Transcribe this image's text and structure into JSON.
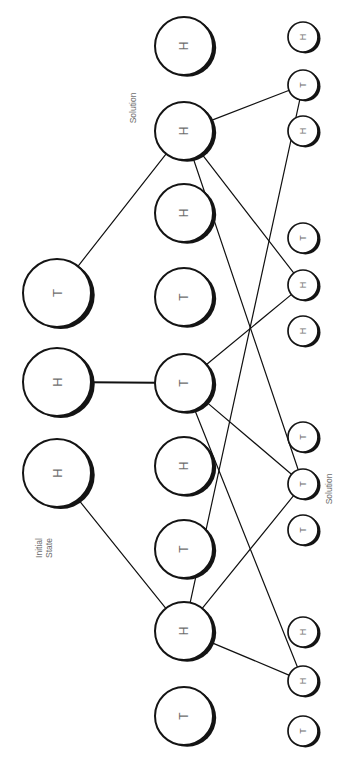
{
  "figure": {
    "orientation_degrees": 90,
    "background_color": "#ffffff",
    "ink_color": "#141414",
    "label_color": "#6e6e6e"
  },
  "annotations": [
    {
      "id": "annot-initial-state",
      "name": "initial-state-label",
      "text": "Initial\nState",
      "lines": [
        "Initial",
        "State"
      ],
      "x": 44,
      "y": 548,
      "rotation": -90
    },
    {
      "id": "annot-solution-left",
      "name": "solution-label-top",
      "text": "Solution",
      "lines": [
        "Solution"
      ],
      "x": 133,
      "y": 108,
      "rotation": -90
    },
    {
      "id": "annot-solution-right",
      "name": "solution-label-bottom",
      "text": "Solution",
      "lines": [
        "Solution"
      ],
      "x": 329,
      "y": 489,
      "rotation": -90
    }
  ],
  "columns": [
    {
      "id": "col-root",
      "name": "root-column",
      "depth": 0,
      "node_radius": 34,
      "node_count": 3
    },
    {
      "id": "col-mid",
      "name": "middle-column",
      "depth": 1,
      "node_radius": 29,
      "node_count": 9
    },
    {
      "id": "col-leaf",
      "name": "leaf-column",
      "depth": 2,
      "node_radius": 15,
      "node_count": 12
    }
  ],
  "nodes": [
    {
      "id": "r0",
      "column": "col-root",
      "label": "T",
      "x": 57,
      "y": 293,
      "r": 34,
      "font_size": 13
    },
    {
      "id": "r1",
      "column": "col-root",
      "label": "H",
      "x": 57,
      "y": 382,
      "r": 34,
      "font_size": 13
    },
    {
      "id": "r2",
      "column": "col-root",
      "label": "H",
      "x": 57,
      "y": 473,
      "r": 34,
      "font_size": 13
    },
    {
      "id": "m0",
      "column": "col-mid",
      "label": "H",
      "x": 184,
      "y": 46,
      "r": 29,
      "font_size": 12
    },
    {
      "id": "m1",
      "column": "col-mid",
      "label": "H",
      "x": 184,
      "y": 131,
      "r": 29,
      "font_size": 12
    },
    {
      "id": "m2",
      "column": "col-mid",
      "label": "H",
      "x": 184,
      "y": 213,
      "r": 29,
      "font_size": 12
    },
    {
      "id": "m3",
      "column": "col-mid",
      "label": "T",
      "x": 184,
      "y": 297,
      "r": 29,
      "font_size": 12
    },
    {
      "id": "m4",
      "column": "col-mid",
      "label": "T",
      "x": 184,
      "y": 383,
      "r": 29,
      "font_size": 12
    },
    {
      "id": "m5",
      "column": "col-mid",
      "label": "H",
      "x": 184,
      "y": 466,
      "r": 29,
      "font_size": 12
    },
    {
      "id": "m6",
      "column": "col-mid",
      "label": "T",
      "x": 184,
      "y": 549,
      "r": 29,
      "font_size": 12
    },
    {
      "id": "m7",
      "column": "col-mid",
      "label": "H",
      "x": 184,
      "y": 631,
      "r": 29,
      "font_size": 12
    },
    {
      "id": "m8",
      "column": "col-mid",
      "label": "T",
      "x": 184,
      "y": 716,
      "r": 29,
      "font_size": 12
    },
    {
      "id": "l0",
      "column": "col-leaf",
      "label": "H",
      "x": 303,
      "y": 37,
      "r": 15,
      "font_size": 9
    },
    {
      "id": "l1",
      "column": "col-leaf",
      "label": "T",
      "x": 303,
      "y": 85,
      "r": 15,
      "font_size": 9
    },
    {
      "id": "l2",
      "column": "col-leaf",
      "label": "H",
      "x": 303,
      "y": 131,
      "r": 15,
      "font_size": 9
    },
    {
      "id": "l3",
      "column": "col-leaf",
      "label": "T",
      "x": 303,
      "y": 238,
      "r": 15,
      "font_size": 9
    },
    {
      "id": "l4",
      "column": "col-leaf",
      "label": "H",
      "x": 303,
      "y": 285,
      "r": 15,
      "font_size": 9
    },
    {
      "id": "l5",
      "column": "col-leaf",
      "label": "H",
      "x": 303,
      "y": 331,
      "r": 15,
      "font_size": 9
    },
    {
      "id": "l6",
      "column": "col-leaf",
      "label": "T",
      "x": 303,
      "y": 437,
      "r": 15,
      "font_size": 9
    },
    {
      "id": "l7",
      "column": "col-leaf",
      "label": "T",
      "x": 303,
      "y": 484,
      "r": 15,
      "font_size": 9
    },
    {
      "id": "l8",
      "column": "col-leaf",
      "label": "T",
      "x": 303,
      "y": 530,
      "r": 15,
      "font_size": 9
    },
    {
      "id": "l9",
      "column": "col-leaf",
      "label": "H",
      "x": 303,
      "y": 632,
      "r": 15,
      "font_size": 9
    },
    {
      "id": "l10",
      "column": "col-leaf",
      "label": "H",
      "x": 303,
      "y": 681,
      "r": 15,
      "font_size": 9
    },
    {
      "id": "l11",
      "column": "col-leaf",
      "label": "T",
      "x": 303,
      "y": 731,
      "r": 15,
      "font_size": 9
    }
  ],
  "edges": [
    {
      "id": "e-r0-m1",
      "from": "r0",
      "to": "m1",
      "stroke_width": 1.2
    },
    {
      "id": "e-r1-m4",
      "from": "r1",
      "to": "m4",
      "stroke_width": 2.1
    },
    {
      "id": "e-r2-m7",
      "from": "r2",
      "to": "m7",
      "stroke_width": 1.2
    },
    {
      "id": "e-m1-l1",
      "from": "m1",
      "to": "l1",
      "stroke_width": 1.2
    },
    {
      "id": "e-m1-l4",
      "from": "m1",
      "to": "l4",
      "stroke_width": 1.2
    },
    {
      "id": "e-m1-l7",
      "from": "m1",
      "to": "l7",
      "stroke_width": 1.2
    },
    {
      "id": "e-m4-l4",
      "from": "m4",
      "to": "l4",
      "stroke_width": 1.2
    },
    {
      "id": "e-m4-l7",
      "from": "m4",
      "to": "l7",
      "stroke_width": 1.2
    },
    {
      "id": "e-m4-l10",
      "from": "m4",
      "to": "l10",
      "stroke_width": 1.2
    },
    {
      "id": "e-m7-l1",
      "from": "m7",
      "to": "l1",
      "stroke_width": 1.2
    },
    {
      "id": "e-m7-l7",
      "from": "m7",
      "to": "l7",
      "stroke_width": 1.2
    },
    {
      "id": "e-m7-l10",
      "from": "m7",
      "to": "l10",
      "stroke_width": 1.2
    }
  ],
  "chart_data": {
    "type": "diagram",
    "diagram_kind": "search-tree",
    "levels": 3,
    "node_labels_by_level": [
      [
        "T",
        "H",
        "H"
      ],
      [
        "H",
        "H",
        "H",
        "T",
        "T",
        "H",
        "T",
        "H",
        "T"
      ],
      [
        "H",
        "T",
        "H",
        "T",
        "H",
        "H",
        "T",
        "T",
        "T",
        "H",
        "H",
        "T"
      ]
    ],
    "annotations": [
      "Initial State",
      "Solution",
      "Solution"
    ]
  }
}
